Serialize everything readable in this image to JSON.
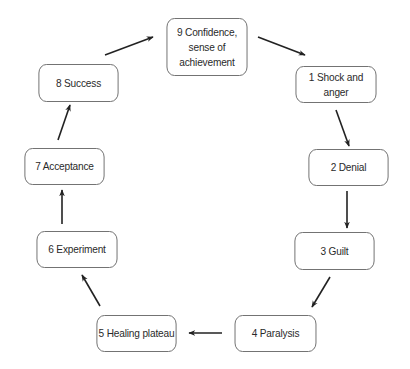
{
  "diagram": {
    "type": "cycle",
    "nodes": [
      {
        "id": "n1",
        "label": "1  Shock and anger",
        "x": 290,
        "y": 66,
        "w": 92,
        "h": 37
      },
      {
        "id": "n2",
        "label": "2  Denial",
        "x": 303,
        "y": 149,
        "w": 91,
        "h": 37
      },
      {
        "id": "n3",
        "label": "3  Guilt",
        "x": 289,
        "y": 232,
        "w": 91,
        "h": 38
      },
      {
        "id": "n4",
        "label": "4  Paralysis",
        "x": 229,
        "y": 315,
        "w": 93,
        "h": 37
      },
      {
        "id": "n5",
        "label": "5  Healing plateau",
        "x": 91,
        "y": 315,
        "w": 91,
        "h": 37
      },
      {
        "id": "n6",
        "label": "6  Experiment",
        "x": 31,
        "y": 231,
        "w": 92,
        "h": 37
      },
      {
        "id": "n7",
        "label": "7  Acceptance",
        "x": 19,
        "y": 148,
        "w": 91,
        "h": 37
      },
      {
        "id": "n8",
        "label": "8  Success",
        "x": 33,
        "y": 64,
        "w": 91,
        "h": 38
      },
      {
        "id": "n9",
        "label": "9  Confidence,\nsense of\nachievement",
        "x": 161,
        "y": 18,
        "w": 92,
        "h": 58
      }
    ],
    "edges": [
      {
        "from": "n9",
        "to": "n1",
        "x1": 258,
        "y1": 37,
        "x2": 305,
        "y2": 55
      },
      {
        "from": "n1",
        "to": "n2",
        "x1": 336,
        "y1": 110,
        "x2": 349,
        "y2": 146
      },
      {
        "from": "n2",
        "to": "n3",
        "x1": 347,
        "y1": 191,
        "x2": 347,
        "y2": 228
      },
      {
        "from": "n3",
        "to": "n4",
        "x1": 330,
        "y1": 277,
        "x2": 312,
        "y2": 307
      },
      {
        "from": "n4",
        "to": "n5",
        "x1": 222,
        "y1": 333,
        "x2": 189,
        "y2": 333
      },
      {
        "from": "n5",
        "to": "n6",
        "x1": 100,
        "y1": 306,
        "x2": 82,
        "y2": 275
      },
      {
        "from": "n6",
        "to": "n7",
        "x1": 62,
        "y1": 224,
        "x2": 62,
        "y2": 190
      },
      {
        "from": "n7",
        "to": "n8",
        "x1": 58,
        "y1": 140,
        "x2": 70,
        "y2": 105
      },
      {
        "from": "n8",
        "to": "n9",
        "x1": 105,
        "y1": 55,
        "x2": 153,
        "y2": 37
      }
    ],
    "colors": {
      "stroke": "#6a6a6a",
      "arrow": "#222222",
      "text": "#2a2a2a",
      "background": "#ffffff"
    }
  }
}
